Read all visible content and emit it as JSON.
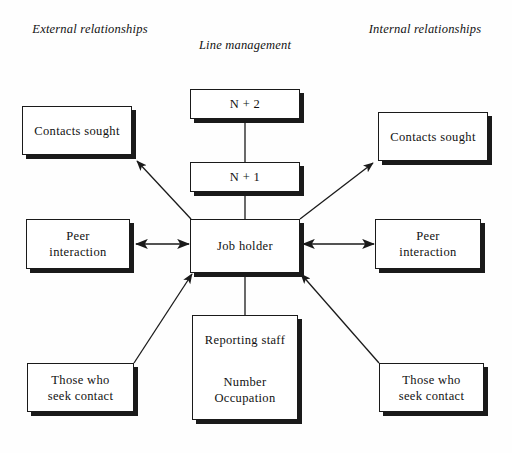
{
  "diagram": {
    "title_columns": [
      {
        "id": "external",
        "lines": [
          "External",
          "relationships"
        ]
      },
      {
        "id": "line-management",
        "lines": [
          "Line management"
        ]
      },
      {
        "id": "internal",
        "lines": [
          "Internal",
          "relationships"
        ]
      }
    ],
    "nodes": {
      "n_plus_2": {
        "lines": [
          "N + 2"
        ]
      },
      "n_plus_1": {
        "lines": [
          "N + 1"
        ]
      },
      "job_holder": {
        "lines": [
          "Job holder"
        ]
      },
      "reporting_staff": {
        "lines": [
          "Reporting staff",
          "Number",
          "Occupation"
        ]
      },
      "external_contacts_sought": {
        "lines": [
          "Contacts sought"
        ]
      },
      "external_peer_interaction": {
        "lines": [
          "Peer",
          "interaction"
        ]
      },
      "external_those_who_seek_contact": {
        "lines": [
          "Those who",
          "seek contact"
        ]
      },
      "internal_contacts_sought": {
        "lines": [
          "Contacts sought"
        ]
      },
      "internal_peer_interaction": {
        "lines": [
          "Peer",
          "interaction"
        ]
      },
      "internal_those_who_seek_contact": {
        "lines": [
          "Those who",
          "seek contact"
        ]
      }
    },
    "colors": {
      "background": "#ffffff",
      "stroke": "#1a1a1a",
      "text": "#111111",
      "shadow": "#1a1a1a"
    }
  }
}
